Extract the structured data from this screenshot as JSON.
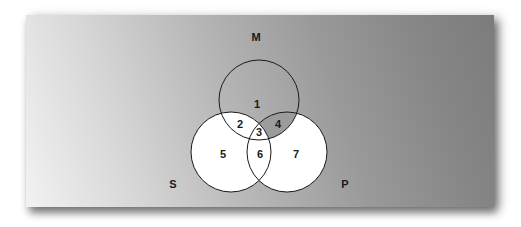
{
  "diagram": {
    "type": "venn-3-set",
    "colors": {
      "background_light": "#f2f2f2",
      "background_dark": "#7c7c7c",
      "circle_fill": "#ffffff",
      "circle_stroke": "#1a1a1a",
      "text": "#1a1a1a"
    },
    "sets": [
      {
        "id": "M",
        "label": "M",
        "cx": 259,
        "cy": 100,
        "r": 40,
        "label_x": 256,
        "label_y": 37
      },
      {
        "id": "S",
        "label": "S",
        "cx": 231,
        "cy": 152,
        "r": 40,
        "label_x": 173,
        "label_y": 184
      },
      {
        "id": "P",
        "label": "P",
        "cx": 287,
        "cy": 152,
        "r": 40,
        "label_x": 345,
        "label_y": 184
      }
    ],
    "regions": [
      {
        "label": "1",
        "x": 257,
        "y": 104,
        "shaded": true
      },
      {
        "label": "2",
        "x": 240,
        "y": 124,
        "shaded": false
      },
      {
        "label": "3",
        "x": 259,
        "y": 132,
        "shaded": false
      },
      {
        "label": "4",
        "x": 278,
        "y": 124,
        "shaded": true
      },
      {
        "label": "5",
        "x": 223,
        "y": 154,
        "shaded": false
      },
      {
        "label": "6",
        "x": 260,
        "y": 154,
        "shaded": false
      },
      {
        "label": "7",
        "x": 296,
        "y": 154,
        "shaded": false
      }
    ]
  }
}
